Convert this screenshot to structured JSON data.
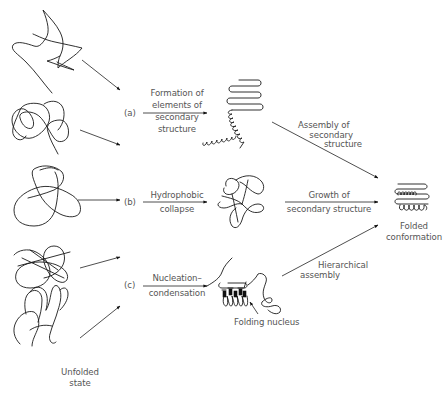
{
  "diagram": {
    "start_state": {
      "label_line1": "Unfolded",
      "label_line2": "state",
      "icon": "random-coil-icon",
      "coil_count": 5
    },
    "pathways": [
      {
        "id": "a",
        "marker": "(a)",
        "step_label": [
          "Formation of",
          "elements of",
          "secondary",
          "structure"
        ],
        "intermediate_icon": "helix-and-sheet-icon",
        "to_final_label": [
          "Assembly of",
          "secondary",
          "structure"
        ]
      },
      {
        "id": "b",
        "marker": "(b)",
        "step_label": [
          "Hydrophobic",
          "collapse"
        ],
        "intermediate_icon": "molten-globule-icon",
        "to_final_label": [
          "Growth of",
          "secondary structure"
        ]
      },
      {
        "id": "c",
        "marker": "(c)",
        "step_label": [
          "Nucleation–",
          "condensation"
        ],
        "intermediate_icon": "folding-nucleus-icon",
        "intermediate_label": "Folding nucleus",
        "to_final_label": [
          "Hierarchical",
          "assembly"
        ]
      }
    ],
    "end_state": {
      "label_line1": "Folded",
      "label_line2": "conformation",
      "icon": "folded-protein-icon"
    },
    "colors": {
      "line": "#1a1a1a",
      "text": "#555555",
      "background": "#ffffff"
    }
  }
}
